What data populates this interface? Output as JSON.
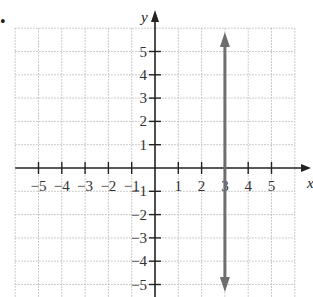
{
  "problem_marker": "•",
  "chart_data": {
    "type": "line",
    "title": "",
    "xlabel": "x",
    "ylabel": "y",
    "xlim": [
      -6,
      6
    ],
    "ylim": [
      -6,
      6
    ],
    "grid": true,
    "grid_style": "dotted",
    "x_ticks": [
      -5,
      -4,
      -3,
      -2,
      -1,
      1,
      2,
      3,
      4,
      5
    ],
    "y_ticks": [
      -5,
      -4,
      -3,
      -2,
      -1,
      1,
      2,
      3,
      4,
      5
    ],
    "x_tick_labels": [
      "−5",
      "−4",
      "−3",
      "−2",
      "−1",
      "1",
      "2",
      "3",
      "4",
      "5"
    ],
    "y_tick_labels": [
      "−5",
      "−4",
      "−3",
      "−2",
      "−1",
      "1",
      "2",
      "3",
      "4",
      "5"
    ],
    "series": [
      {
        "name": "x = 3",
        "equation": "x = 3",
        "kind": "vertical line",
        "x": [
          3,
          3
        ],
        "y": [
          -6,
          6
        ],
        "arrows": "both ends",
        "color": "#6e6e6e"
      }
    ],
    "colors": {
      "axis": "#222222",
      "grid": "#bbbbbb",
      "line": "#6e6e6e"
    }
  }
}
